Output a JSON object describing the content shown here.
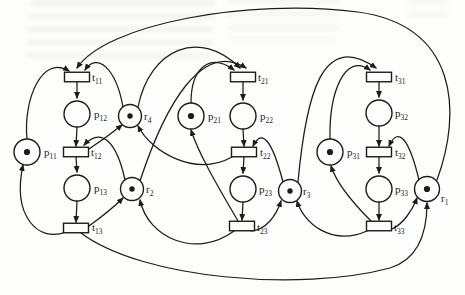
{
  "figure": {
    "type": "petri-net-diagram",
    "canvas": {
      "width": 465,
      "height": 295
    },
    "ink_color": "#1c1c1c",
    "paper_color": "#fdfdfb"
  },
  "petri_net": {
    "places": [
      {
        "id": "p11",
        "label": "p11",
        "kind": "idle-place",
        "x": 27,
        "y": 152,
        "r": 13,
        "tokens": 1,
        "label_x": 44,
        "label_y": 156
      },
      {
        "id": "p12",
        "label": "p12",
        "kind": "operation-place",
        "x": 77,
        "y": 114,
        "r": 13,
        "tokens": 0,
        "label_x": 94,
        "label_y": 118
      },
      {
        "id": "p13",
        "label": "p13",
        "kind": "operation-place",
        "x": 77,
        "y": 188,
        "r": 13,
        "tokens": 0,
        "label_x": 94,
        "label_y": 192
      },
      {
        "id": "p21",
        "label": "p21",
        "kind": "idle-place",
        "x": 191,
        "y": 116,
        "r": 13,
        "tokens": 1,
        "label_x": 208,
        "label_y": 120
      },
      {
        "id": "p22",
        "label": "p22",
        "kind": "operation-place",
        "x": 243,
        "y": 116,
        "r": 13,
        "tokens": 0,
        "label_x": 260,
        "label_y": 120
      },
      {
        "id": "p23",
        "label": "p23",
        "kind": "operation-place",
        "x": 243,
        "y": 189,
        "r": 13,
        "tokens": 0,
        "label_x": 259,
        "label_y": 193
      },
      {
        "id": "p31",
        "label": "p31",
        "kind": "idle-place",
        "x": 330,
        "y": 152,
        "r": 13,
        "tokens": 1,
        "label_x": 347,
        "label_y": 156
      },
      {
        "id": "p32",
        "label": "p32",
        "kind": "operation-place",
        "x": 379,
        "y": 113,
        "r": 13,
        "tokens": 0,
        "label_x": 395,
        "label_y": 117
      },
      {
        "id": "p33",
        "label": "p33",
        "kind": "operation-place",
        "x": 379,
        "y": 189,
        "r": 13,
        "tokens": 0,
        "label_x": 395,
        "label_y": 193
      },
      {
        "id": "r4",
        "label": "r4",
        "kind": "resource-place",
        "x": 130,
        "y": 116,
        "r": 11.5,
        "tokens": 1,
        "label_x": 144,
        "label_y": 120
      },
      {
        "id": "r2",
        "label": "r2",
        "kind": "resource-place",
        "x": 132,
        "y": 189,
        "r": 11.5,
        "tokens": 1,
        "label_x": 146,
        "label_y": 193
      },
      {
        "id": "r3",
        "label": "r3",
        "kind": "resource-place",
        "x": 290,
        "y": 191,
        "r": 11.5,
        "tokens": 1,
        "label_x": 303,
        "label_y": 195
      },
      {
        "id": "r1",
        "label": "r1",
        "kind": "resource-place",
        "x": 427,
        "y": 189,
        "r": 12.5,
        "tokens": 1,
        "label_x": 441,
        "label_y": 202
      }
    ],
    "transitions": [
      {
        "id": "t11",
        "label": "t11",
        "x": 77,
        "y": 77,
        "w": 25,
        "h": 9.5,
        "label_x": 92,
        "label_y": 81
      },
      {
        "id": "t12",
        "label": "t12",
        "x": 76,
        "y": 152,
        "w": 25,
        "h": 9.5,
        "label_x": 91,
        "label_y": 156
      },
      {
        "id": "t13",
        "label": "t13",
        "x": 76,
        "y": 228,
        "w": 25,
        "h": 9.5,
        "label_x": 92,
        "label_y": 231
      },
      {
        "id": "t21",
        "label": "t21",
        "x": 243,
        "y": 77,
        "w": 25,
        "h": 9.5,
        "label_x": 258,
        "label_y": 81
      },
      {
        "id": "t22",
        "label": "t22",
        "x": 244,
        "y": 152,
        "w": 25,
        "h": 9.5,
        "label_x": 260,
        "label_y": 156
      },
      {
        "id": "t23",
        "label": "t23",
        "x": 242,
        "y": 226,
        "w": 25,
        "h": 9.5,
        "label_x": 257,
        "label_y": 231
      },
      {
        "id": "t31",
        "label": "t31",
        "x": 379,
        "y": 77,
        "w": 25,
        "h": 9.5,
        "label_x": 395,
        "label_y": 81
      },
      {
        "id": "t32",
        "label": "t32",
        "x": 379,
        "y": 152,
        "w": 25,
        "h": 9.5,
        "label_x": 395,
        "label_y": 156
      },
      {
        "id": "t33",
        "label": "t33",
        "x": 379,
        "y": 226,
        "w": 25,
        "h": 9.5,
        "label_x": 394,
        "label_y": 231
      }
    ],
    "arcs": [
      {
        "from": "t11",
        "to": "p12",
        "path": "M77,82 L77,98"
      },
      {
        "from": "p12",
        "to": "t12",
        "path": "M77,127 L76,146"
      },
      {
        "from": "t12",
        "to": "p13",
        "path": "M76,157 L77,172"
      },
      {
        "from": "p13",
        "to": "t13",
        "path": "M77,201 L76,222"
      },
      {
        "from": "t21",
        "to": "p22",
        "path": "M243,82 L243,100"
      },
      {
        "from": "p22",
        "to": "t22",
        "path": "M243,129 L244,146"
      },
      {
        "from": "t22",
        "to": "p23",
        "path": "M244,157 L243,173"
      },
      {
        "from": "p23",
        "to": "t23",
        "path": "M243,202 L242,220"
      },
      {
        "from": "t31",
        "to": "p32",
        "path": "M379,82 L379,97"
      },
      {
        "from": "p32",
        "to": "t32",
        "path": "M379,126 L379,146"
      },
      {
        "from": "t32",
        "to": "p33",
        "path": "M379,157 L379,173"
      },
      {
        "from": "p33",
        "to": "t33",
        "path": "M379,202 L379,220"
      },
      {
        "from": "p11",
        "to": "t11",
        "path": "M27,139 C23,100 42,54 69,71"
      },
      {
        "from": "t13",
        "to": "p11",
        "path": "M66,232 C38,243 12,216 23,165"
      },
      {
        "from": "p21",
        "to": "t21",
        "path": "M191,103 C191,66 211,53 234,70"
      },
      {
        "from": "t23",
        "to": "p21",
        "path": "M238,221 C220,190 199,155 191,130"
      },
      {
        "from": "p31",
        "to": "t31",
        "path": "M330,139 C329,92 345,52 370,70"
      },
      {
        "from": "t33",
        "to": "p31",
        "path": "M371,221 C352,202 336,182 331,166"
      },
      {
        "from": "r4",
        "to": "t11",
        "path": "M123,107 C116,68 97,52 85,70"
      },
      {
        "from": "r4",
        "to": "t21",
        "path": "M138,107 C150,48 200,28 240,68"
      },
      {
        "from": "t12",
        "to": "r4",
        "path": "M89,149 C101,141 112,133 122,125"
      },
      {
        "from": "t22",
        "to": "r4",
        "path": "M232,157 C196,177 152,153 138,126"
      },
      {
        "from": "r2",
        "to": "t12",
        "path": "M125,180 C117,143 102,126 84,145"
      },
      {
        "from": "r2",
        "to": "t21",
        "path": "M140,181 C165,105 202,40 246,68"
      },
      {
        "from": "t13",
        "to": "r2",
        "path": "M89,226 C100,218 113,208 123,198"
      },
      {
        "from": "t23",
        "to": "r2",
        "path": "M234,231 C196,259 148,238 140,200"
      },
      {
        "from": "r3",
        "to": "t22",
        "path": "M283,182 C272,140 262,128 253,146"
      },
      {
        "from": "r3",
        "to": "t31",
        "path": "M298,182 C306,95 322,30 376,68"
      },
      {
        "from": "t23",
        "to": "r3",
        "path": "M251,231 C266,230 276,216 281,201"
      },
      {
        "from": "t33",
        "to": "r3",
        "path": "M367,231 C331,247 303,222 297,201"
      },
      {
        "from": "r1",
        "to": "t32",
        "path": "M419,180 C409,138 398,126 389,146"
      },
      {
        "from": "r1",
        "to": "t11",
        "path": "M437,180 C462,112 458,26 358,12 C248,-2 106,24 77,68"
      },
      {
        "from": "t33",
        "to": "r1",
        "path": "M392,229 C403,224 412,211 417,198"
      },
      {
        "from": "t13",
        "to": "r1",
        "path": "M81,233 C142,279 300,292 390,268 C419,259 427,231 427,203"
      }
    ]
  }
}
